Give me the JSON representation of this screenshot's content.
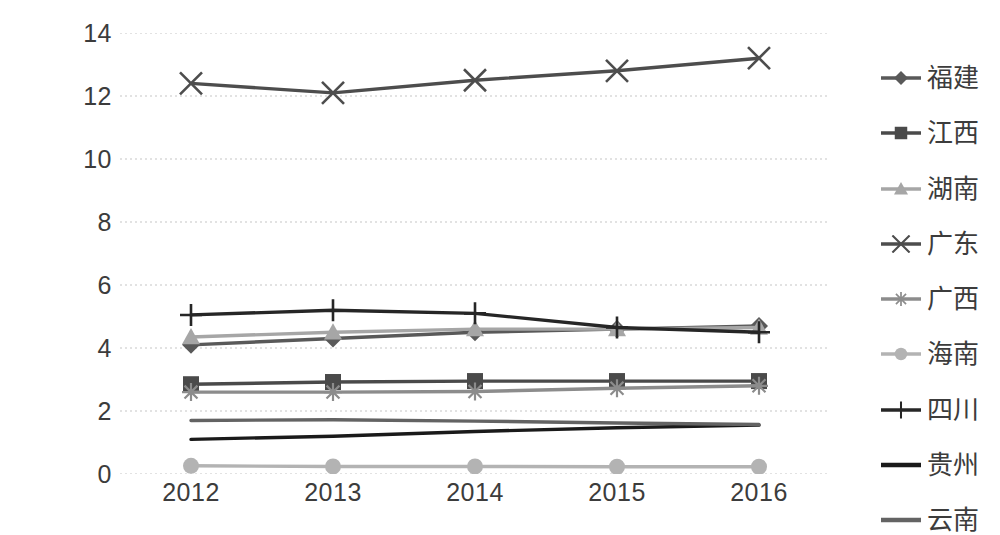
{
  "chart_data": {
    "type": "line",
    "title": "",
    "subtitle": "",
    "xlabel": "",
    "ylabel": "",
    "categories": [
      "2012",
      "2013",
      "2014",
      "2015",
      "2016"
    ],
    "x_tick_labels": [
      "2012",
      "2013",
      "2014",
      "2015",
      "2016"
    ],
    "y_tick_labels": [
      "0",
      "2",
      "4",
      "6",
      "8",
      "10",
      "12",
      "14"
    ],
    "y_ticks": [
      0,
      2,
      4,
      6,
      8,
      10,
      12,
      14
    ],
    "ylim": [
      0,
      14
    ],
    "grid": "horizontal-dotted",
    "legend_position": "right",
    "series": [
      {
        "name": "福建",
        "marker": "diamond",
        "color": "#595959",
        "values": [
          4.1,
          4.3,
          4.5,
          4.6,
          4.7
        ]
      },
      {
        "name": "江西",
        "marker": "square",
        "color": "#4a4a4a",
        "values": [
          2.85,
          2.92,
          2.95,
          2.95,
          2.95
        ]
      },
      {
        "name": "湖南",
        "marker": "triangle",
        "color": "#a6a6a6",
        "values": [
          4.35,
          4.5,
          4.6,
          4.6,
          4.65
        ]
      },
      {
        "name": "广东",
        "marker": "x",
        "color": "#4d4d4d",
        "values": [
          12.4,
          12.1,
          12.5,
          12.8,
          13.2
        ]
      },
      {
        "name": "广西",
        "marker": "asterisk",
        "color": "#8c8c8c",
        "values": [
          2.6,
          2.6,
          2.62,
          2.72,
          2.8
        ]
      },
      {
        "name": "海南",
        "marker": "circle",
        "color": "#b3b3b3",
        "values": [
          0.26,
          0.24,
          0.24,
          0.23,
          0.23
        ]
      },
      {
        "name": "四川",
        "marker": "plus",
        "color": "#262626",
        "values": [
          5.05,
          5.2,
          5.1,
          4.65,
          4.5
        ]
      },
      {
        "name": "贵州",
        "marker": "none",
        "color": "#1a1a1a",
        "values": [
          1.1,
          1.2,
          1.35,
          1.47,
          1.55
        ]
      },
      {
        "name": "云南",
        "marker": "none",
        "color": "#636363",
        "values": [
          1.7,
          1.72,
          1.68,
          1.62,
          1.57
        ]
      }
    ]
  },
  "colors": {
    "background": "#ffffff",
    "gridline": "#d9d9d9",
    "axis_text": "#3c3c3c"
  }
}
